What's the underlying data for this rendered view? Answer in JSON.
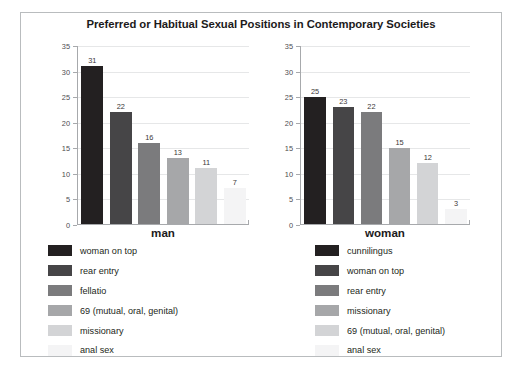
{
  "title": "Preferred or Habitual Sexual Positions in Contemporary Societies",
  "palette": {
    "s1": "#232021",
    "s2": "#464547",
    "s3": "#7b7b7d",
    "s4": "#a6a7a9",
    "s5": "#d3d4d6",
    "s6": "#f4f4f5",
    "gridline": "#e6e7e8",
    "axis": "#a7a9ac",
    "frame_border": "#b9bcbe",
    "text": "#231f20"
  },
  "panels": [
    {
      "name": "man",
      "category_label": "man",
      "ylim": [
        0,
        35
      ],
      "yticks": [
        "0",
        "5",
        "10",
        "15",
        "20",
        "25",
        "30",
        "35"
      ],
      "bars": [
        {
          "label": "woman on top",
          "value": 31,
          "value_text": "31",
          "color": "#232021"
        },
        {
          "label": "rear entry",
          "value": 22,
          "value_text": "22",
          "color": "#464547"
        },
        {
          "label": "fellatio",
          "value": 16,
          "value_text": "16",
          "color": "#7b7b7d"
        },
        {
          "label": "69 (mutual, oral, genital)",
          "value": 13,
          "value_text": "13",
          "color": "#a6a7a9"
        },
        {
          "label": "missionary",
          "value": 11,
          "value_text": "11",
          "color": "#d3d4d6"
        },
        {
          "label": "anal sex",
          "value": 7,
          "value_text": "7",
          "color": "#f4f4f5"
        }
      ]
    },
    {
      "name": "woman",
      "category_label": "woman",
      "ylim": [
        0,
        35
      ],
      "yticks": [
        "0",
        "5",
        "10",
        "15",
        "20",
        "25",
        "30",
        "35"
      ],
      "bars": [
        {
          "label": "cunnilingus",
          "value": 25,
          "value_text": "25",
          "color": "#232021"
        },
        {
          "label": "woman on top",
          "value": 23,
          "value_text": "23",
          "color": "#464547"
        },
        {
          "label": "rear entry",
          "value": 22,
          "value_text": "22",
          "color": "#7b7b7d"
        },
        {
          "label": "missionary",
          "value": 15,
          "value_text": "15",
          "color": "#a6a7a9"
        },
        {
          "label": "69 (mutual, oral, genital)",
          "value": 12,
          "value_text": "12",
          "color": "#d3d4d6"
        },
        {
          "label": "anal sex",
          "value": 3,
          "value_text": "3",
          "color": "#f4f4f5"
        }
      ]
    }
  ],
  "chart_data": {
    "type": "bar",
    "title": "Preferred or Habitual Sexual Positions in Contemporary Societies",
    "subtitle": "",
    "xlabel": "",
    "ylabel": "",
    "grid": true,
    "legend_position": "below-each-panel",
    "panels": [
      {
        "name": "man",
        "categories": [
          "woman on top",
          "rear entry",
          "fellatio",
          "69 (mutual, oral, genital)",
          "missionary",
          "anal sex"
        ],
        "values": [
          31,
          22,
          16,
          13,
          11,
          7
        ],
        "ylim": [
          0,
          35
        ],
        "ytick_values": [
          0,
          5,
          10,
          15,
          20,
          25,
          30,
          35
        ],
        "data_labels": [
          "31",
          "22",
          "16",
          "13",
          "11",
          "7"
        ]
      },
      {
        "name": "woman",
        "categories": [
          "cunnilingus",
          "woman on top",
          "rear entry",
          "missionary",
          "69 (mutual, oral, genital)",
          "anal sex"
        ],
        "values": [
          25,
          23,
          22,
          15,
          12,
          3
        ],
        "ylim": [
          0,
          35
        ],
        "ytick_values": [
          0,
          5,
          10,
          15,
          20,
          25,
          30,
          35
        ],
        "data_labels": [
          "25",
          "23",
          "22",
          "15",
          "12",
          "3"
        ]
      }
    ]
  }
}
